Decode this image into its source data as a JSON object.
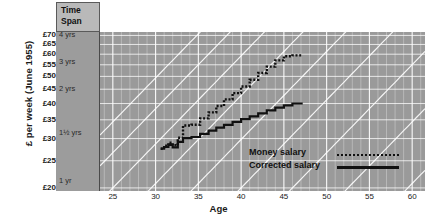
{
  "chart_data": {
    "type": "line",
    "title": "",
    "xlabel": "Age",
    "ylabel": "£ per week (June 1955)",
    "xlim": [
      23.5,
      61.5
    ],
    "ylim": [
      19.5,
      72
    ],
    "yscale": "log",
    "xticks": [
      25,
      30,
      35,
      40,
      45,
      50,
      55,
      60
    ],
    "yticks": [
      20,
      25,
      30,
      35,
      40,
      45,
      50,
      55,
      60,
      65,
      70
    ],
    "ytick_labels": [
      "£20",
      "£25",
      "£30",
      "£35",
      "£40",
      "£45",
      "£50",
      "£55",
      "£60",
      "£65",
      "£70"
    ],
    "grid": true,
    "legend_position": "lower right",
    "series": [
      {
        "name": "Money salary",
        "style": "dotted",
        "x": [
          30.6,
          31.0,
          31.0,
          31.5,
          31.5,
          32.0,
          32.0,
          32.6,
          32.6,
          33.2,
          33.2,
          34.2,
          34.2,
          35.2,
          35.2,
          36.2,
          36.2,
          37.1,
          37.1,
          38.0,
          38.0,
          39.0,
          39.0,
          40.0,
          40.0,
          41.0,
          41.0,
          42.0,
          42.0,
          43.0,
          43.0,
          44.0,
          44.0,
          45.0,
          45.0,
          46.0,
          46.0,
          47.2
        ],
        "y": [
          27.6,
          27.6,
          28.3,
          28.3,
          29.0,
          29.0,
          28.4,
          28.4,
          30.2,
          30.2,
          33.4,
          33.4,
          33.6,
          33.6,
          35.4,
          35.4,
          37.2,
          37.2,
          39.2,
          39.2,
          41.4,
          41.4,
          43.6,
          43.6,
          46.0,
          46.0,
          48.6,
          48.6,
          51.4,
          51.4,
          54.2,
          54.2,
          57.0,
          57.0,
          59.0,
          59.0,
          59.4,
          59.4
        ]
      },
      {
        "name": "Corrected salary",
        "style": "solid",
        "x": [
          30.6,
          31.0,
          31.0,
          31.5,
          31.5,
          32.0,
          32.0,
          32.6,
          32.6,
          33.2,
          33.2,
          34.2,
          34.2,
          35.2,
          35.2,
          36.2,
          36.2,
          37.1,
          37.1,
          38.0,
          38.0,
          39.0,
          39.0,
          40.0,
          40.0,
          41.0,
          41.0,
          42.0,
          42.0,
          43.0,
          43.0,
          44.0,
          44.0,
          45.0,
          45.0,
          46.0,
          46.0,
          47.2
        ],
        "y": [
          27.6,
          27.6,
          28.0,
          28.0,
          28.5,
          28.5,
          27.9,
          27.9,
          29.2,
          29.2,
          30.1,
          30.1,
          30.4,
          30.4,
          31.2,
          31.2,
          32.0,
          32.0,
          32.8,
          32.8,
          33.6,
          33.6,
          34.4,
          34.4,
          35.2,
          35.2,
          36.0,
          36.0,
          36.9,
          36.9,
          37.8,
          37.8,
          38.7,
          38.7,
          39.4,
          39.4,
          40.0,
          40.0
        ]
      }
    ],
    "span_column": {
      "header_line1": "Time",
      "header_line2": "Span",
      "labels": [
        {
          "text": "4 yrs",
          "value": 70
        },
        {
          "text": "3 yrs",
          "value": 56.5
        },
        {
          "text": "2 yrs",
          "value": 45
        },
        {
          "text": "1½ yrs",
          "value": 31.5
        },
        {
          "text": "1 yr",
          "value": 21.2
        }
      ]
    },
    "diagonals": {
      "description": "white diagonal time-span gridlines",
      "count": 9
    }
  },
  "colors": {
    "plot_background": "#9a9a9a",
    "span_background": "#9c9c9c",
    "gridline": "#ffffff",
    "line": "#111111",
    "page_background": "#ffffff",
    "header_box": "#b9b9b9"
  },
  "legend": {
    "items": [
      {
        "label": "Money salary",
        "style": "dotted"
      },
      {
        "label": "Corrected salary",
        "style": "solid"
      }
    ]
  }
}
